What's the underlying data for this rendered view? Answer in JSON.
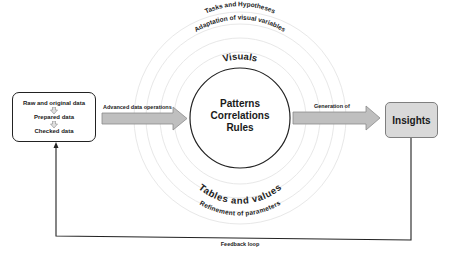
{
  "diagram": {
    "source_box": {
      "steps": [
        "Raw and original data",
        "Prepared data",
        "Checked data"
      ]
    },
    "arrow_left": {
      "label": "Advanced data operations"
    },
    "arrow_right": {
      "label": "Generation of"
    },
    "center": {
      "lines": [
        "Patterns",
        "Correlations",
        "Rules"
      ]
    },
    "rings": {
      "top_outer": "Tasks and Hypotheses",
      "top_middle": "Adaptation of visual variables",
      "top_inner": "Visuals",
      "bottom_inner": "Tables and values",
      "bottom_outer": "Refinement of parameters"
    },
    "target_box": {
      "label": "Insights"
    },
    "feedback": {
      "label": "Feedback loop"
    },
    "colors": {
      "arrow_fill": "#bfbfbf",
      "arrow_stroke": "#8c8c8c",
      "insights_fill": "#d9d9d9",
      "insights_border": "#7f7f7f",
      "ring_stroke": "#e6e6e6",
      "line": "#222222"
    }
  }
}
